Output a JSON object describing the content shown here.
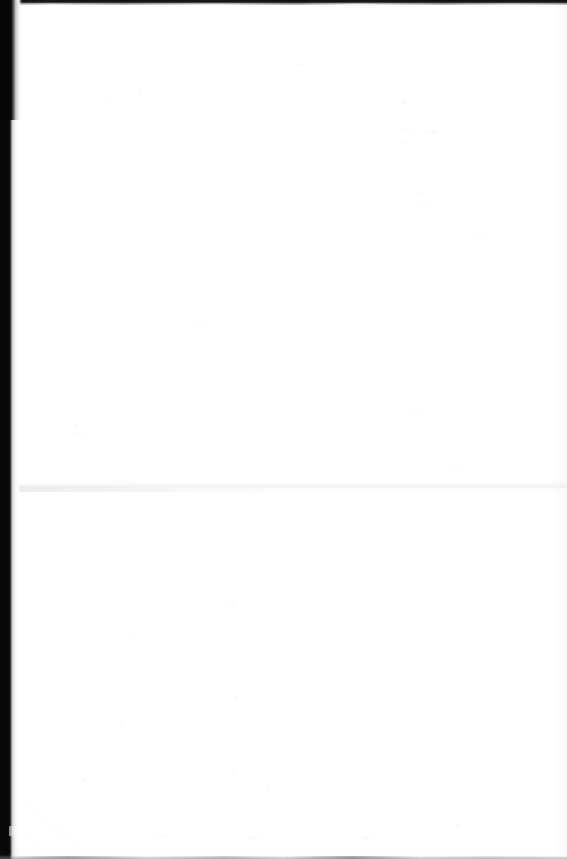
{
  "document": {
    "page_type": "blank-scanned-page",
    "content_text": "",
    "visible_text_count": 0,
    "description": "Blank scanned book page — no printed text, headings, figures or page number are visible."
  },
  "canvas": {
    "width_px": 567,
    "height_px": 859,
    "paper_color": "#ffffff"
  },
  "artifacts": {
    "gutter": {
      "label": "binding-gutter-shadow",
      "edge": "left",
      "dark_color": "#070707",
      "falloff_color": "#ebebeb",
      "band_width_px": 19
    },
    "top_edge": {
      "label": "scanner-top-edge-band",
      "color": "#1d1d1d",
      "thickness_px": 4
    },
    "bottom_edge": {
      "label": "scanner-bottom-smudge",
      "color": "#78787a",
      "thickness_px": 4
    },
    "crease": {
      "label": "horizontal-fold-crease",
      "color": "#eeeef2",
      "y_px": 486
    },
    "speckle": {
      "label": "scanner-speckle-noise",
      "color": "#f4f4f6"
    }
  }
}
